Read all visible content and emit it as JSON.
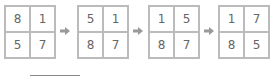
{
  "grids": [
    {
      "cells": [
        "8",
        "1",
        "5",
        "7"
      ]
    },
    {
      "cells": [
        "5",
        "1",
        "8",
        "7"
      ]
    },
    {
      "cells": [
        "1",
        "5",
        "8",
        "7"
      ]
    },
    {
      "cells": [
        "1",
        "7",
        "8",
        "5"
      ]
    }
  ],
  "arrow_color": "#999999",
  "underline": ""
}
